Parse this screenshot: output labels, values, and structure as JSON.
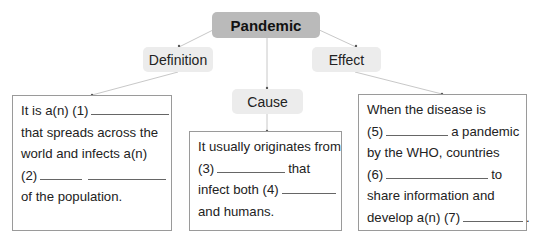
{
  "root": {
    "label": "Pandemic"
  },
  "branches": {
    "definition": {
      "label": "Definition",
      "lines": [
        {
          "pre": "It is a(n) (1)",
          "blank": 78,
          "post": ""
        },
        {
          "pre": "that spreads across the",
          "blank": 0,
          "post": ""
        },
        {
          "pre": "world and infects a(n)",
          "blank": 0,
          "post": ""
        },
        {
          "pre": "(2)",
          "blank": 42,
          "post": "",
          "blank2": 78
        },
        {
          "pre": "of the population.",
          "blank": 0,
          "post": ""
        }
      ]
    },
    "cause": {
      "label": "Cause",
      "lines": [
        {
          "pre": "It usually originates from",
          "blank": 0,
          "post": ""
        },
        {
          "pre": "(3)",
          "blank": 68,
          "post": "that"
        },
        {
          "pre": "infect both (4)",
          "blank": 54,
          "post": ""
        },
        {
          "pre": "and humans.",
          "blank": 0,
          "post": ""
        }
      ]
    },
    "effect": {
      "label": "Effect",
      "lines": [
        {
          "pre": "When the disease is",
          "blank": 0,
          "post": ""
        },
        {
          "pre": "(5)",
          "blank": 62,
          "post": "a pandemic"
        },
        {
          "pre": "by the WHO, countries",
          "blank": 0,
          "post": ""
        },
        {
          "pre": "(6)",
          "blank": 102,
          "post": "to"
        },
        {
          "pre": "share information and",
          "blank": 0,
          "post": ""
        },
        {
          "pre": "develop a(n) (7)",
          "blank": 60,
          "post": "."
        }
      ]
    }
  },
  "colors": {
    "root_bg": "#bababa",
    "sub_bg": "#ececec",
    "border": "#9a9a9a",
    "link": "#c8c8c8"
  }
}
